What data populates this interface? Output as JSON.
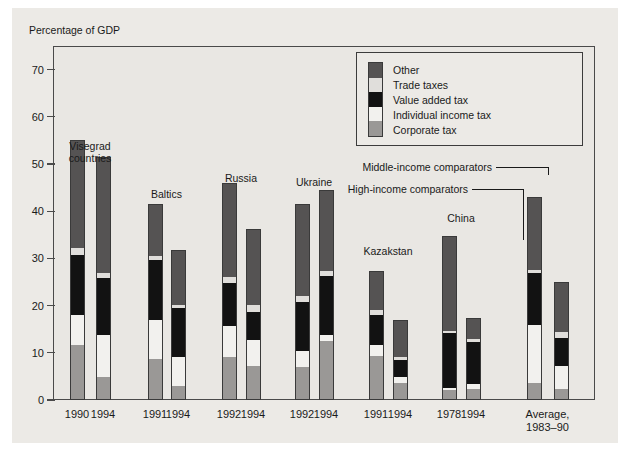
{
  "figure": {
    "axis_caption": "Percentage of GDP",
    "background": "#eceae6",
    "plot_background": "#e9e7e3",
    "frame_color": "#4a4a4a"
  },
  "legend": {
    "position": "inside-top-right",
    "items": [
      {
        "label": "Other",
        "color": "#555353",
        "key": "other"
      },
      {
        "label": "Trade taxes",
        "color": "#e0dedb",
        "key": "trade"
      },
      {
        "label": "Value added tax",
        "color": "#121212",
        "key": "vat"
      },
      {
        "label": "Individual income tax",
        "color": "#f2f1ee",
        "key": "iit"
      },
      {
        "label": "Corporate tax",
        "color": "#9a9896",
        "key": "corp"
      }
    ]
  },
  "annotations": [
    {
      "text": "Middle-income comparators",
      "target_bar_index": 12
    },
    {
      "text": "High-income comparators",
      "target_bar_index": 13
    }
  ],
  "chart_data": {
    "type": "bar",
    "subtype": "stacked-bar",
    "title": "",
    "xlabel": "",
    "ylabel": "Percentage of GDP",
    "ylim": [
      0,
      75
    ],
    "yticks": [
      0,
      10,
      20,
      30,
      40,
      50,
      60,
      70
    ],
    "ytick_labels": [
      "0",
      "10",
      "20",
      "30",
      "40",
      "50",
      "60",
      "70"
    ],
    "grid": false,
    "legend_position": "upper right",
    "series": [
      {
        "name": "Corporate tax",
        "key": "corp",
        "color": "#9a9896",
        "values": [
          11.7,
          4.9,
          8.6,
          3.0,
          9.1,
          7.2,
          7.0,
          12.5,
          9.3,
          3.7,
          2.1,
          2.3,
          3.7,
          2.4
        ]
      },
      {
        "name": "Individual income tax",
        "key": "iit",
        "color": "#f2f1ee",
        "values": [
          6.3,
          8.9,
          8.3,
          6.1,
          6.6,
          5.6,
          3.3,
          1.2,
          2.4,
          1.2,
          0.4,
          1.0,
          12.3,
          4.9
        ]
      },
      {
        "name": "Value added tax",
        "key": "vat",
        "color": "#121212",
        "values": [
          12.7,
          12.1,
          12.8,
          10.3,
          9.1,
          5.9,
          10.5,
          12.6,
          6.4,
          3.6,
          11.6,
          9.0,
          11.0,
          5.8
        ]
      },
      {
        "name": "Trade taxes",
        "key": "trade",
        "color": "#e0dedb",
        "values": [
          1.5,
          1.1,
          0.9,
          0.8,
          1.2,
          1.4,
          1.2,
          1.0,
          0.9,
          0.6,
          0.5,
          0.6,
          0.6,
          1.3
        ]
      },
      {
        "name": "Other",
        "key": "other",
        "color": "#555353",
        "values": [
          22.8,
          24.5,
          10.9,
          11.5,
          20.0,
          16.1,
          19.5,
          17.1,
          8.4,
          7.9,
          20.2,
          4.4,
          15.4,
          10.6
        ]
      }
    ],
    "categories": [
      "1990",
      "1994",
      "1991",
      "1994",
      "1992",
      "1994",
      "1992",
      "1994",
      "1991",
      "1994",
      "1978",
      "1994",
      "Average,\n1983–90",
      "Average,\n1983–90"
    ],
    "totals": [
      55.0,
      51.5,
      41.5,
      31.7,
      46.0,
      36.2,
      41.5,
      44.4,
      27.4,
      17.0,
      34.8,
      17.3,
      43.0,
      25.0
    ],
    "groups": [
      {
        "label": "Visegrad\ncountries",
        "bars": [
          0,
          1
        ]
      },
      {
        "label": "Baltics",
        "bars": [
          2,
          3
        ]
      },
      {
        "label": "Russia",
        "bars": [
          4,
          5
        ]
      },
      {
        "label": "Ukraine",
        "bars": [
          6,
          7
        ]
      },
      {
        "label": "Kazakstan",
        "bars": [
          8,
          9
        ]
      },
      {
        "label": "China",
        "bars": [
          10,
          11
        ]
      },
      {
        "label": "",
        "bars": [
          12,
          13
        ]
      }
    ]
  },
  "x_tick_labels": [
    {
      "text": "1990",
      "bar": 0
    },
    {
      "text": "1994",
      "bar": 1
    },
    {
      "text": "1991",
      "bar": 2
    },
    {
      "text": "1994",
      "bar": 3
    },
    {
      "text": "1992",
      "bar": 4
    },
    {
      "text": "1994",
      "bar": 5
    },
    {
      "text": "1992",
      "bar": 6
    },
    {
      "text": "1994",
      "bar": 7
    },
    {
      "text": "1991",
      "bar": 8
    },
    {
      "text": "1994",
      "bar": 9
    },
    {
      "text": "1978",
      "bar": 10
    },
    {
      "text": "1994",
      "bar": 11
    },
    {
      "text": "Average,\n1983–90",
      "bar": 12,
      "span": true
    }
  ]
}
